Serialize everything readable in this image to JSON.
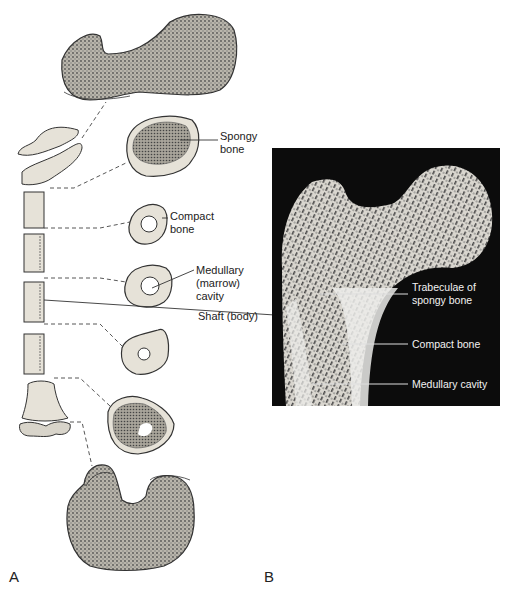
{
  "panel_a": {
    "letter": "A",
    "labels": {
      "spongy_bone": [
        "Spongy",
        "bone"
      ],
      "compact_bone": [
        "Compact",
        "bone"
      ],
      "medullary_cavity": [
        "Medullary",
        "(marrow)",
        "cavity"
      ],
      "shaft": "Shaft (body)"
    }
  },
  "panel_b": {
    "letter": "B",
    "labels": {
      "trabeculae": [
        "Trabeculae of",
        "spongy bone"
      ],
      "compact_bone": "Compact bone",
      "medullary_cavity": "Medullary cavity"
    }
  },
  "colors": {
    "background": "#ffffff",
    "bone_fill": "#e6e2d8",
    "spongy_fill": "#9a968c",
    "outline": "#333333",
    "photo_bg": "#0c0c0c"
  }
}
